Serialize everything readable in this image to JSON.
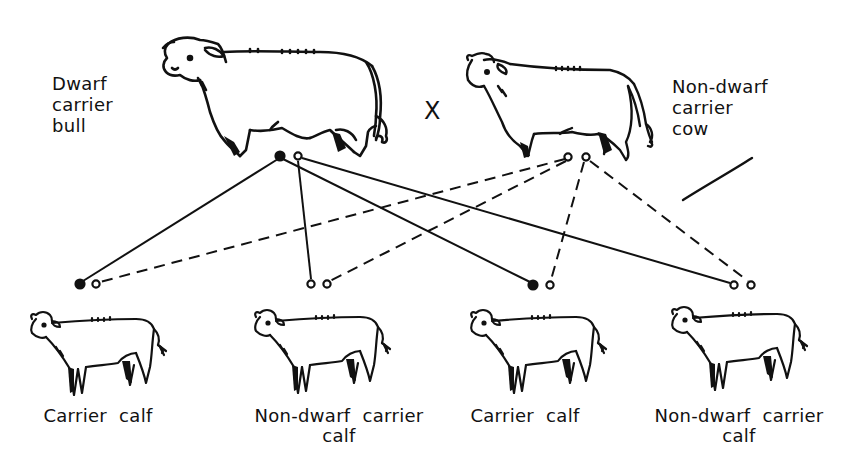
{
  "diagram": {
    "type": "genetic-cross",
    "cross_symbol": "X",
    "legend_semantics": {
      "filled_dot": "dwarf gene",
      "open_dot": "normal gene",
      "solid_line": "gene from bull",
      "dashed_line": "gene from cow"
    },
    "parents": [
      {
        "id": "bull",
        "label_lines": [
          "Dwarf",
          "carrier",
          "bull"
        ],
        "genes": [
          {
            "type": "filled",
            "x": 280,
            "y": 156
          },
          {
            "type": "open",
            "x": 298,
            "y": 156
          }
        ]
      },
      {
        "id": "cow",
        "label_lines": [
          "Non-dwarf",
          "carrier",
          "cow"
        ],
        "genes": [
          {
            "type": "open",
            "x": 568,
            "y": 157
          },
          {
            "type": "open",
            "x": 586,
            "y": 157
          }
        ]
      }
    ],
    "offspring": [
      {
        "id": "calf-1",
        "label_line1": "Carrier  calf",
        "label_line2": "",
        "genes": [
          {
            "type": "filled",
            "x": 80,
            "y": 284
          },
          {
            "type": "open",
            "x": 96,
            "y": 284
          }
        ]
      },
      {
        "id": "calf-2",
        "label_line1": "Non-dwarf  carrier",
        "label_line2": "calf",
        "genes": [
          {
            "type": "open",
            "x": 311,
            "y": 284
          },
          {
            "type": "open",
            "x": 327,
            "y": 284
          }
        ]
      },
      {
        "id": "calf-3",
        "label_line1": "Carrier  calf",
        "label_line2": "",
        "genes": [
          {
            "type": "filled",
            "x": 533,
            "y": 285
          },
          {
            "type": "open",
            "x": 550,
            "y": 285
          }
        ]
      },
      {
        "id": "calf-4",
        "label_line1": "Non-dwarf  carrier",
        "label_line2": "calf",
        "genes": [
          {
            "type": "open",
            "x": 734,
            "y": 285
          },
          {
            "type": "open",
            "x": 751,
            "y": 285
          }
        ]
      }
    ],
    "connections": [
      {
        "from": "bull.0",
        "to": "calf-1.0",
        "style": "solid"
      },
      {
        "from": "bull.1",
        "to": "calf-2.0",
        "style": "solid"
      },
      {
        "from": "bull.0",
        "to": "calf-3.0",
        "style": "solid"
      },
      {
        "from": "bull.1",
        "to": "calf-4.0",
        "style": "solid"
      },
      {
        "from": "cow.0",
        "to": "calf-1.1",
        "style": "dashed"
      },
      {
        "from": "cow.0",
        "to": "calf-2.1",
        "style": "dashed"
      },
      {
        "from": "cow.1",
        "to": "calf-3.1",
        "style": "dashed"
      },
      {
        "from": "cow.1",
        "to": "calf-4.1",
        "style": "dashed"
      }
    ],
    "colors": {
      "ink": "#111111",
      "background": "#ffffff"
    }
  }
}
